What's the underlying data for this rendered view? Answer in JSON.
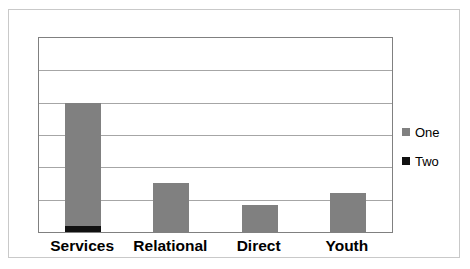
{
  "chart_data": {
    "type": "bar",
    "title": "",
    "subtitle": "",
    "xlabel": "",
    "ylabel": "",
    "grid": true,
    "gridline_count": 5,
    "legend_position": "right",
    "ylim": [
      0,
      6
    ],
    "yticks": [
      0,
      1,
      2,
      3,
      4,
      5,
      6
    ],
    "ytick_labels": [],
    "categories": [
      "Services",
      "Relational",
      "Direct",
      "Youth"
    ],
    "series": [
      {
        "name": "One",
        "color": "#808080",
        "values": [
          4.0,
          1.5,
          0.85,
          1.2
        ]
      },
      {
        "name": "Two",
        "color": "#111111",
        "values": [
          0.18,
          0,
          0,
          0
        ]
      }
    ],
    "annotations": []
  },
  "chart": {
    "frame_color": "#c9c9c9",
    "plot_border_color": "#808080",
    "gridline_color": "#a6a6a6",
    "background": "#ffffff"
  },
  "legend": {
    "items": [
      {
        "label": "One",
        "color": "#808080",
        "swatch": "square-swatch"
      },
      {
        "label": "Two",
        "color": "#111111",
        "swatch": "square-swatch"
      }
    ]
  }
}
